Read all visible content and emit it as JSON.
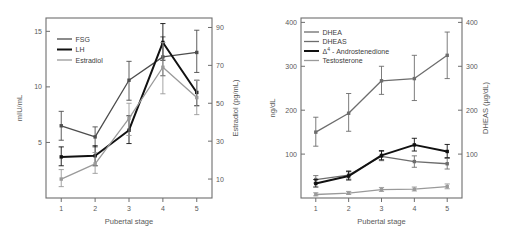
{
  "figure": {
    "panels": [
      "left-gonadotropin-panel",
      "right-androgen-panel"
    ]
  },
  "chart_data": [
    {
      "type": "line",
      "id": "gonadotropins-estradiol",
      "title": "",
      "xlabel": "Pubertal stage",
      "ylabel": "mIU/mL",
      "y2label": "Estradiol (pg/mL)",
      "categories": [
        "1",
        "2",
        "3",
        "4",
        "5"
      ],
      "x": [
        1,
        2,
        3,
        4,
        5
      ],
      "xlim": [
        0.55,
        5.45
      ],
      "ylim": [
        0,
        16.2
      ],
      "y2lim": [
        0,
        95
      ],
      "yticks": [
        5,
        10,
        15
      ],
      "y2ticks": [
        10,
        30,
        50,
        70,
        90
      ],
      "xticks": [
        "1",
        "2",
        "3",
        "4",
        "5"
      ],
      "grid": false,
      "legend_position": "top-left",
      "series": [
        {
          "name": "FSG",
          "axis": "left",
          "color": "#4d4d4d",
          "width": 1.3,
          "values": [
            6.5,
            5.5,
            10.6,
            12.7,
            13.1
          ],
          "err_low": [
            5.2,
            4.6,
            8.8,
            11.0,
            11.3
          ],
          "err_high": [
            7.8,
            6.4,
            12.3,
            14.5,
            15.1
          ]
        },
        {
          "name": "LH",
          "axis": "left",
          "color": "#111111",
          "width": 2.0,
          "values": [
            3.7,
            3.8,
            6.1,
            14.0,
            9.5
          ],
          "err_low": [
            2.9,
            2.9,
            4.9,
            12.4,
            8.3
          ],
          "err_high": [
            4.6,
            4.7,
            7.4,
            15.7,
            10.6
          ]
        },
        {
          "name": "Estradiol",
          "axis": "right",
          "color": "#9a9a9a",
          "width": 1.3,
          "values": [
            10,
            18,
            42,
            69,
            53
          ],
          "err_low": [
            6,
            13,
            33,
            55,
            44
          ],
          "err_high": [
            15,
            24,
            50,
            82,
            62
          ]
        }
      ]
    },
    {
      "type": "line",
      "id": "androgens-dheas",
      "title": "",
      "xlabel": "Pubertal stage",
      "ylabel": "ng/dL",
      "y2label": "DHEAS (µg/dL)",
      "categories": [
        "1",
        "2",
        "3",
        "4",
        "5"
      ],
      "x": [
        1,
        2,
        3,
        4,
        5
      ],
      "xlim": [
        0.55,
        5.45
      ],
      "ylim": [
        0,
        410
      ],
      "y2lim": [
        0,
        410
      ],
      "yticks": [
        100,
        200,
        300,
        400
      ],
      "y2ticks": [
        100,
        200,
        300,
        400
      ],
      "xticks": [
        "1",
        "2",
        "3",
        "4",
        "5"
      ],
      "grid": false,
      "legend_position": "top-left",
      "series": [
        {
          "name": "DHEA",
          "axis": "left",
          "color": "#6d6d6d",
          "width": 1.3,
          "values": [
            42,
            52,
            95,
            83,
            78
          ],
          "err_low": [
            34,
            43,
            85,
            70,
            66
          ],
          "err_high": [
            51,
            62,
            106,
            96,
            90
          ]
        },
        {
          "name": "DHEAS",
          "axis": "right",
          "color": "#6d6d6d",
          "width": 1.3,
          "values": [
            150,
            193,
            267,
            272,
            325
          ],
          "err_low": [
            118,
            152,
            236,
            222,
            272
          ],
          "err_high": [
            184,
            238,
            300,
            325,
            378
          ]
        },
        {
          "name": "Δ⁴ - Androstenedione",
          "axis": "left",
          "color": "#111111",
          "width": 2.0,
          "values": [
            33,
            50,
            97,
            121,
            106
          ],
          "err_low": [
            25,
            41,
            87,
            107,
            92
          ],
          "err_high": [
            42,
            60,
            108,
            136,
            122
          ]
        },
        {
          "name": "Testosterone",
          "axis": "left",
          "color": "#9a9a9a",
          "width": 1.3,
          "values": [
            8,
            11,
            19,
            20,
            26
          ],
          "err_low": [
            5,
            8,
            15,
            16,
            21
          ],
          "err_high": [
            12,
            15,
            24,
            25,
            32
          ]
        }
      ]
    }
  ]
}
